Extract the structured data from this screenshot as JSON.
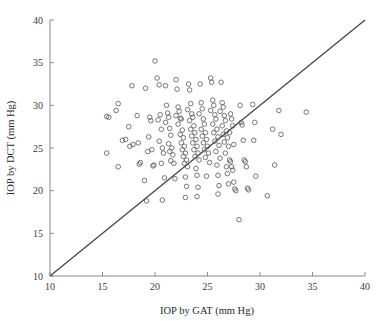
{
  "chart_data": {
    "type": "scatter",
    "title": "",
    "xlabel": "IOP by GAT (mm Hg)",
    "ylabel": "IOP by DCT (mm Hg)",
    "xlim": [
      10,
      40
    ],
    "ylim": [
      10,
      40
    ],
    "xticks": [
      10,
      15,
      20,
      25,
      30,
      35,
      40
    ],
    "yticks": [
      10,
      15,
      20,
      25,
      30,
      35,
      40
    ],
    "xtick_labels": [
      "10",
      "15",
      "20",
      "25",
      "30",
      "35",
      "40"
    ],
    "ytick_labels": [
      "10",
      "15",
      "20",
      "25",
      "30",
      "35",
      "40"
    ],
    "grid": false,
    "legend": "none",
    "marker": "open-circle",
    "marker_color": "#555555",
    "marker_size": 4.6,
    "reference_line": {
      "name": "line-of-identity",
      "from": [
        10,
        10
      ],
      "to": [
        40,
        40
      ],
      "color": "#4a4a4a",
      "width": 1.4
    },
    "series": [
      {
        "name": "GAT vs DCT measurements",
        "points": [
          [
            15.4,
            28.7
          ],
          [
            15.6,
            28.6
          ],
          [
            15.4,
            24.4
          ],
          [
            16.3,
            29.4
          ],
          [
            16.5,
            30.2
          ],
          [
            16.5,
            22.8
          ],
          [
            16.9,
            25.9
          ],
          [
            17.2,
            26.0
          ],
          [
            17.8,
            32.3
          ],
          [
            17.5,
            27.5
          ],
          [
            17.6,
            25.2
          ],
          [
            17.9,
            25.4
          ],
          [
            18.4,
            25.6
          ],
          [
            18.3,
            28.8
          ],
          [
            18.5,
            23.1
          ],
          [
            18.6,
            23.3
          ],
          [
            19.0,
            21.2
          ],
          [
            19.2,
            18.8
          ],
          [
            19.4,
            26.3
          ],
          [
            19.3,
            24.6
          ],
          [
            19.1,
            32.0
          ],
          [
            19.5,
            28.6
          ],
          [
            19.6,
            28.2
          ],
          [
            19.7,
            24.8
          ],
          [
            19.8,
            22.9
          ],
          [
            19.9,
            23.0
          ],
          [
            20.0,
            35.2
          ],
          [
            20.2,
            33.2
          ],
          [
            20.4,
            32.4
          ],
          [
            20.3,
            28.3
          ],
          [
            20.5,
            28.9
          ],
          [
            20.6,
            27.2
          ],
          [
            20.4,
            25.8
          ],
          [
            20.7,
            25.0
          ],
          [
            20.8,
            24.4
          ],
          [
            20.6,
            23.2
          ],
          [
            20.9,
            21.5
          ],
          [
            20.7,
            18.9
          ],
          [
            21.0,
            32.3
          ],
          [
            21.1,
            30.0
          ],
          [
            21.2,
            29.1
          ],
          [
            21.3,
            28.6
          ],
          [
            21.0,
            28.0
          ],
          [
            21.4,
            27.3
          ],
          [
            21.5,
            26.5
          ],
          [
            21.3,
            25.5
          ],
          [
            21.6,
            25.0
          ],
          [
            21.4,
            24.6
          ],
          [
            21.7,
            24.2
          ],
          [
            21.5,
            23.5
          ],
          [
            21.8,
            23.2
          ],
          [
            21.9,
            21.4
          ],
          [
            22.0,
            33.0
          ],
          [
            22.1,
            31.9
          ],
          [
            22.2,
            29.8
          ],
          [
            22.3,
            29.3
          ],
          [
            22.0,
            28.8
          ],
          [
            22.4,
            28.5
          ],
          [
            22.5,
            28.4
          ],
          [
            22.2,
            27.8
          ],
          [
            22.6,
            27.1
          ],
          [
            22.4,
            26.6
          ],
          [
            22.7,
            26.2
          ],
          [
            22.5,
            25.6
          ],
          [
            22.8,
            25.2
          ],
          [
            22.6,
            24.8
          ],
          [
            22.9,
            24.4
          ],
          [
            22.7,
            24.0
          ],
          [
            23.0,
            23.6
          ],
          [
            22.8,
            23.2
          ],
          [
            23.1,
            22.8
          ],
          [
            22.9,
            21.6
          ],
          [
            23.0,
            20.5
          ],
          [
            22.9,
            19.2
          ],
          [
            23.2,
            32.5
          ],
          [
            23.3,
            31.8
          ],
          [
            23.4,
            30.2
          ],
          [
            23.1,
            29.5
          ],
          [
            23.5,
            29.0
          ],
          [
            23.6,
            28.6
          ],
          [
            23.3,
            28.2
          ],
          [
            23.7,
            27.6
          ],
          [
            23.4,
            27.2
          ],
          [
            23.8,
            26.8
          ],
          [
            23.5,
            26.4
          ],
          [
            23.9,
            26.0
          ],
          [
            23.6,
            25.6
          ],
          [
            24.0,
            25.2
          ],
          [
            23.7,
            24.8
          ],
          [
            24.1,
            24.4
          ],
          [
            23.8,
            24.0
          ],
          [
            24.2,
            23.6
          ],
          [
            23.9,
            22.6
          ],
          [
            24.0,
            21.8
          ],
          [
            24.1,
            20.4
          ],
          [
            24.0,
            19.3
          ],
          [
            24.3,
            32.5
          ],
          [
            24.4,
            30.3
          ],
          [
            24.5,
            29.6
          ],
          [
            24.2,
            29.0
          ],
          [
            24.6,
            28.4
          ],
          [
            24.7,
            27.8
          ],
          [
            24.4,
            27.2
          ],
          [
            24.8,
            26.8
          ],
          [
            24.5,
            26.4
          ],
          [
            24.9,
            26.0
          ],
          [
            24.6,
            25.6
          ],
          [
            25.0,
            25.2
          ],
          [
            24.7,
            24.8
          ],
          [
            25.1,
            24.4
          ],
          [
            24.8,
            23.9
          ],
          [
            25.2,
            23.3
          ],
          [
            24.9,
            21.7
          ],
          [
            25.3,
            33.2
          ],
          [
            25.4,
            32.7
          ],
          [
            25.5,
            30.6
          ],
          [
            25.6,
            30.0
          ],
          [
            25.3,
            29.4
          ],
          [
            25.7,
            28.9
          ],
          [
            25.8,
            28.4
          ],
          [
            25.5,
            27.8
          ],
          [
            25.9,
            27.2
          ],
          [
            25.6,
            26.8
          ],
          [
            26.0,
            26.3
          ],
          [
            25.7,
            25.8
          ],
          [
            26.1,
            25.3
          ],
          [
            25.8,
            24.6
          ],
          [
            26.2,
            23.8
          ],
          [
            25.9,
            23.0
          ],
          [
            26.0,
            21.8
          ],
          [
            26.1,
            20.6
          ],
          [
            26.0,
            19.6
          ],
          [
            26.3,
            32.7
          ],
          [
            26.4,
            30.3
          ],
          [
            26.5,
            29.8
          ],
          [
            26.2,
            29.3
          ],
          [
            26.6,
            28.8
          ],
          [
            26.7,
            28.2
          ],
          [
            26.4,
            27.6
          ],
          [
            26.8,
            27.0
          ],
          [
            26.5,
            26.6
          ],
          [
            26.9,
            26.2
          ],
          [
            26.6,
            25.7
          ],
          [
            27.0,
            25.2
          ],
          [
            26.7,
            24.4
          ],
          [
            27.1,
            23.6
          ],
          [
            26.8,
            22.8
          ],
          [
            26.9,
            22.0
          ],
          [
            27.0,
            20.8
          ],
          [
            27.2,
            29.0
          ],
          [
            27.3,
            28.4
          ],
          [
            27.4,
            27.6
          ],
          [
            27.1,
            26.8
          ],
          [
            27.5,
            25.4
          ],
          [
            27.2,
            23.4
          ],
          [
            27.3,
            22.8
          ],
          [
            27.4,
            22.4
          ],
          [
            27.5,
            21.0
          ],
          [
            27.6,
            20.2
          ],
          [
            27.7,
            20.0
          ],
          [
            28.0,
            16.6
          ],
          [
            28.1,
            30.0
          ],
          [
            28.2,
            28.0
          ],
          [
            28.3,
            27.7
          ],
          [
            28.4,
            25.9
          ],
          [
            28.5,
            23.6
          ],
          [
            28.6,
            23.4
          ],
          [
            28.7,
            22.8
          ],
          [
            28.8,
            20.3
          ],
          [
            28.9,
            20.1
          ],
          [
            29.3,
            30.1
          ],
          [
            29.5,
            28.0
          ],
          [
            29.4,
            25.9
          ],
          [
            29.6,
            21.7
          ],
          [
            30.7,
            19.4
          ],
          [
            31.2,
            27.2
          ],
          [
            31.4,
            23.0
          ],
          [
            31.8,
            29.4
          ],
          [
            32.0,
            26.6
          ],
          [
            34.4,
            29.2
          ]
        ]
      }
    ]
  },
  "axis": {
    "x_title": "IOP by GAT (mm Hg)",
    "y_title": "IOP by DCT (mm Hg)"
  }
}
